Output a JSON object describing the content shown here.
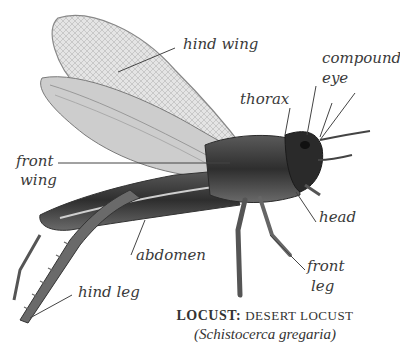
{
  "diagram": {
    "title_bold": "LOCUST:",
    "title_rest": "DESERT LOCUST",
    "scientific_name": "(Schistocerca gregaria)",
    "labels": {
      "hind_wing": "hind wing",
      "compound_eye_1": "compound",
      "compound_eye_2": "eye",
      "thorax": "thorax",
      "front_wing_1": "front",
      "front_wing_2": "wing",
      "head": "head",
      "abdomen": "abdomen",
      "front_leg_1": "front",
      "front_leg_2": "leg",
      "hind_leg": "hind leg"
    },
    "colors": {
      "label_text": "#3a3a3a",
      "leader_line": "#444444",
      "body_dark": "#3c3c3c",
      "wing_light": "#cfcfcf"
    }
  }
}
